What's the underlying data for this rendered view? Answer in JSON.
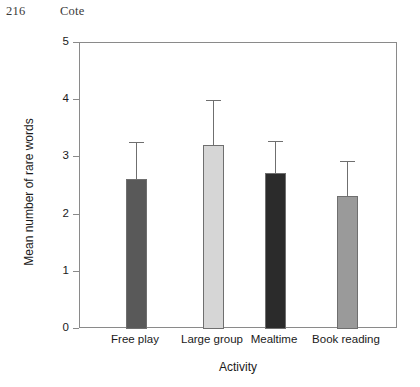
{
  "page": {
    "folio": "216",
    "running_head": "Cote"
  },
  "chart_data": {
    "type": "bar",
    "title": "",
    "xlabel": "Activity",
    "ylabel": "Mean number of rare words",
    "categories": [
      "Free play",
      "Large group",
      "Mealtime",
      "Book reading"
    ],
    "values": [
      2.63,
      3.21,
      2.72,
      2.33
    ],
    "errors_upper": [
      3.27,
      4.0,
      3.29,
      2.94
    ],
    "error_bar_direction": "upper-only",
    "bar_colors": [
      "#595959",
      "#d6d6d6",
      "#2b2b2b",
      "#9a9a9a"
    ],
    "ylim": [
      0,
      5
    ],
    "yticks": [
      "0",
      "1",
      "2",
      "3",
      "4",
      "5"
    ],
    "grid": false,
    "legend": "none"
  }
}
